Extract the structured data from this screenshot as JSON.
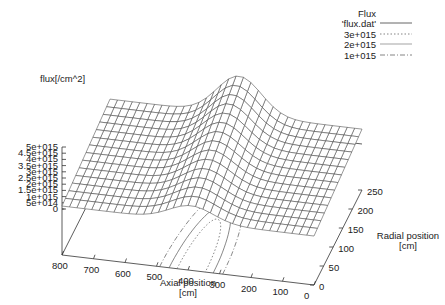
{
  "chart_data": {
    "type": "surface3d",
    "title": "",
    "zlabel": "flux[/cm^2]",
    "xlabel": "Axial position\n[cm]",
    "xlabel_lines": [
      "Axial position",
      "[cm]"
    ],
    "ylabel_lines": [
      "Radial position",
      "[cm]"
    ],
    "x_ticks": [
      800,
      700,
      600,
      500,
      400,
      300,
      200,
      100,
      0
    ],
    "y_ticks": [
      0,
      50,
      100,
      150,
      200,
      250
    ],
    "z_ticks": [
      "5e+015",
      "4.5e+015",
      "4e+015",
      "3.5e+015",
      "3e+015",
      "2.5e+015",
      "2e+015",
      "1.5e+015",
      "1e+015",
      "5e+014",
      "0"
    ],
    "z_tick_values": [
      5000000000000000.0,
      4500000000000000.0,
      4000000000000000.0,
      3500000000000000.0,
      3000000000000000.0,
      2500000000000000.0,
      2000000000000000.0,
      1500000000000000.0,
      1000000000000000.0,
      500000000000000.0,
      0
    ],
    "xlim": [
      0,
      800
    ],
    "ylim": [
      0,
      250
    ],
    "zlim": [
      0,
      5000000000000000.0
    ],
    "surface": {
      "name": "'flux.dat'",
      "description": "Gaussian-like peak along axial position, decreasing with radius",
      "axial_peak_cm": 390,
      "axial_sigma_cm": 70,
      "peak_flux_at_r250": 4300000000000000.0,
      "base_flux": 1200000000000000.0,
      "radial_decay": "flux decreases toward r=0 (front) edge",
      "grid_axial_lines": 34,
      "grid_radial_lines": 14
    },
    "contours": [
      {
        "level": "3e+015",
        "style": "dotted"
      },
      {
        "level": "2e+015",
        "style": "solid-thin"
      },
      {
        "level": "1e+015",
        "style": "dash-dot"
      }
    ],
    "legend": {
      "title": "Flux",
      "entries": [
        {
          "label": "'flux.dat'",
          "style": "solid"
        },
        {
          "label": "3e+015",
          "style": "dotted"
        },
        {
          "label": "2e+015",
          "style": "solid-thin"
        },
        {
          "label": "1e+015",
          "style": "dash-dot"
        }
      ],
      "position": "top-right"
    },
    "grid": false
  }
}
